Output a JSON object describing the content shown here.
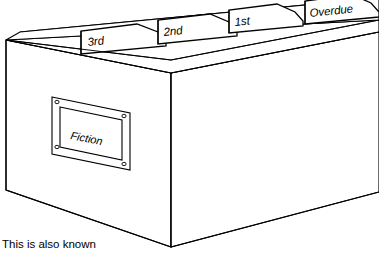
{
  "figure": {
    "line_color": "#000000",
    "fill_color": "#ffffff",
    "caption": "This is also known"
  },
  "box": {
    "front_label_plate": {
      "text": "Fiction",
      "screw_count": 4
    }
  },
  "dividers": [
    {
      "label": "3rd"
    },
    {
      "label": "2nd"
    },
    {
      "label": "1st"
    },
    {
      "label": "Overdue"
    }
  ]
}
